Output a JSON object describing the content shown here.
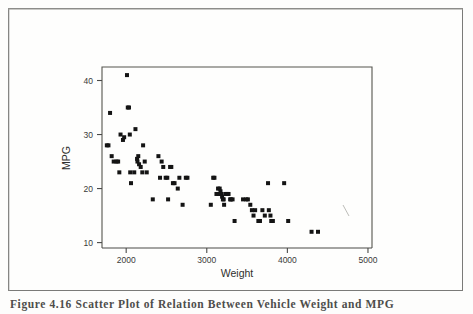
{
  "figure": {
    "caption": "Figure 4.16 Scatter Plot of Relation Between Vehicle Weight and MPG",
    "border_color": "#7a7a78",
    "background_color": "#fdfdfc",
    "marker_color": "#141414"
  },
  "chart_data": {
    "type": "scatter",
    "title": "",
    "xlabel": "Weight",
    "ylabel": "MPG",
    "xlim": [
      1700,
      5050
    ],
    "ylim": [
      9,
      42.5
    ],
    "xticks": [
      2000,
      3000,
      4000,
      5000
    ],
    "yticks": [
      10,
      20,
      30,
      40
    ],
    "xtick_labels": [
      "2000",
      "3000",
      "4000",
      "5000"
    ],
    "ytick_labels": [
      "10",
      "20",
      "30",
      "40"
    ],
    "grid": false,
    "legend": false,
    "marker_shape": "square",
    "marker_size": 4,
    "series": [
      {
        "name": "vehicles",
        "points": [
          [
            1760,
            28
          ],
          [
            1780,
            28
          ],
          [
            1800,
            34
          ],
          [
            1820,
            26
          ],
          [
            1845,
            25
          ],
          [
            1880,
            25
          ],
          [
            1900,
            25
          ],
          [
            1915,
            23
          ],
          [
            1930,
            30
          ],
          [
            1960,
            29
          ],
          [
            1975,
            29.5
          ],
          [
            2010,
            41
          ],
          [
            2020,
            35
          ],
          [
            2035,
            35
          ],
          [
            2045,
            30
          ],
          [
            2050,
            23
          ],
          [
            2060,
            21
          ],
          [
            2100,
            23
          ],
          [
            2115,
            31
          ],
          [
            2135,
            25.5
          ],
          [
            2140,
            25
          ],
          [
            2150,
            26
          ],
          [
            2160,
            24.5
          ],
          [
            2180,
            24
          ],
          [
            2200,
            23
          ],
          [
            2210,
            28
          ],
          [
            2230,
            25
          ],
          [
            2255,
            23
          ],
          [
            2330,
            18
          ],
          [
            2400,
            26
          ],
          [
            2420,
            22
          ],
          [
            2440,
            25
          ],
          [
            2460,
            24
          ],
          [
            2490,
            22
          ],
          [
            2510,
            22
          ],
          [
            2520,
            18
          ],
          [
            2545,
            24
          ],
          [
            2560,
            24
          ],
          [
            2580,
            21
          ],
          [
            2600,
            21
          ],
          [
            2640,
            20
          ],
          [
            2660,
            22
          ],
          [
            2700,
            17
          ],
          [
            2740,
            22
          ],
          [
            2760,
            22
          ],
          [
            3050,
            17
          ],
          [
            3080,
            22
          ],
          [
            3095,
            22
          ],
          [
            3120,
            19
          ],
          [
            3140,
            20
          ],
          [
            3150,
            19
          ],
          [
            3160,
            20
          ],
          [
            3170,
            19.5
          ],
          [
            3180,
            19
          ],
          [
            3190,
            18.5
          ],
          [
            3200,
            18
          ],
          [
            3210,
            18
          ],
          [
            3215,
            17
          ],
          [
            3230,
            19
          ],
          [
            3250,
            19
          ],
          [
            3270,
            19
          ],
          [
            3290,
            18
          ],
          [
            3300,
            18
          ],
          [
            3320,
            18
          ],
          [
            3345,
            14
          ],
          [
            3450,
            18
          ],
          [
            3490,
            18
          ],
          [
            3510,
            18
          ],
          [
            3540,
            17
          ],
          [
            3560,
            16
          ],
          [
            3580,
            15
          ],
          [
            3600,
            16
          ],
          [
            3640,
            14
          ],
          [
            3660,
            14
          ],
          [
            3690,
            16
          ],
          [
            3720,
            15
          ],
          [
            3760,
            21
          ],
          [
            3770,
            16
          ],
          [
            3790,
            15
          ],
          [
            3800,
            14
          ],
          [
            3820,
            14
          ],
          [
            3960,
            21
          ],
          [
            4010,
            14
          ],
          [
            4300,
            12
          ],
          [
            4380,
            12
          ]
        ]
      }
    ]
  }
}
